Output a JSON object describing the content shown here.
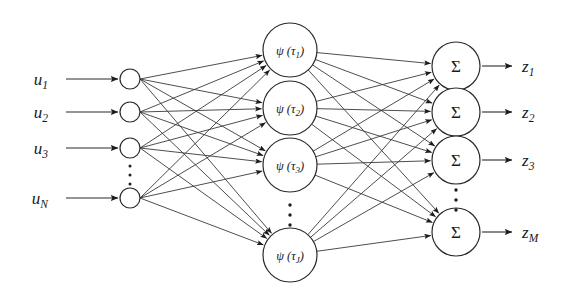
{
  "figure": {
    "background_color": "#ffffff",
    "stroke_color": "#2b2b2b",
    "edge_color": "#3a3a3a",
    "width": 567,
    "height": 297
  },
  "input_layer": {
    "name": "input-layer",
    "node_radius": 10,
    "node_x": 130,
    "label_x": 48,
    "arrow_start_x": 66,
    "arrow_end_x": 118,
    "nodes": [
      {
        "label_base": "u",
        "label_sub": "1",
        "y": 79
      },
      {
        "label_base": "u",
        "label_sub": "2",
        "y": 112
      },
      {
        "label_base": "u",
        "label_sub": "3",
        "y": 148
      },
      {
        "label_base": "u",
        "label_sub": "N",
        "y": 198
      }
    ],
    "ellipsis": {
      "x": 130,
      "ys": [
        166,
        175,
        184
      ]
    }
  },
  "hidden_layer": {
    "name": "hidden-layer",
    "node_radius": 27,
    "node_x": 290,
    "nodes": [
      {
        "label_fn": "ψ",
        "label_arg": "τ",
        "label_sub": "1",
        "y": 50
      },
      {
        "label_fn": "ψ",
        "label_arg": "τ",
        "label_sub": "2",
        "y": 108
      },
      {
        "label_fn": "ψ",
        "label_arg": "τ",
        "label_sub": "3",
        "y": 165
      },
      {
        "label_fn": "ψ",
        "label_arg": "τ",
        "label_sub": "J",
        "y": 255
      }
    ],
    "ellipsis": {
      "x": 290,
      "ys": [
        205,
        215,
        225
      ]
    }
  },
  "output_layer": {
    "name": "output-layer",
    "node_radius": 24,
    "node_x": 456,
    "node_symbol": "Σ",
    "arrow_start_x": 482,
    "arrow_end_x": 512,
    "label_x": 522,
    "nodes": [
      {
        "label_base": "z",
        "label_sub": "1",
        "y": 66
      },
      {
        "label_base": "z",
        "label_sub": "2",
        "y": 112
      },
      {
        "label_base": "z",
        "label_sub": "3",
        "y": 160
      },
      {
        "label_base": "z",
        "label_sub": "M",
        "y": 232
      }
    ],
    "ellipsis": {
      "x": 456,
      "ys": [
        190,
        200,
        210
      ]
    }
  },
  "connections": {
    "input_to_hidden": "fully-connected",
    "hidden_to_output": "fully-connected",
    "arrowheads": true
  }
}
